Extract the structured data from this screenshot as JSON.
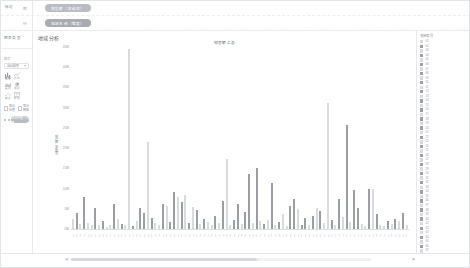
{
  "shelf": {
    "corner_label": "标记",
    "rows": [
      {
        "axis_label": "列  ",
        "pill": "销售额（求和项）"
      },
      {
        "axis_label": "行  ",
        "pill": "地域名称（维度）"
      }
    ]
  },
  "sidebar": {
    "title": "图表类型",
    "style_label": "样式",
    "select_value": "自动配色",
    "mark_icons": [
      {
        "name": "bar-icon",
        "cap": "柱形"
      },
      {
        "name": "line-icon",
        "cap": "折线"
      },
      {
        "name": "area-icon",
        "cap": "面积"
      },
      {
        "name": "pie-icon",
        "cap": "饼图"
      },
      {
        "name": "scatter-icon",
        "cap": "散点"
      },
      {
        "name": "table-icon",
        "cap": "表格"
      }
    ],
    "checkboxes": [
      {
        "label": "显示标签"
      },
      {
        "label": "显示网格"
      }
    ],
    "apply_button": "应用到整个视图"
  },
  "canvas": {
    "header": "地域分析",
    "legend_title": "地域编号"
  },
  "chart_data": {
    "type": "bar",
    "title": "销售额汇总",
    "xlabel": "",
    "ylabel": "销售额（求和项）",
    "ylim": [
      0,
      45000000
    ],
    "grid": false,
    "legend_position": "right",
    "ytick_labels": [
      "45M",
      "40M",
      "35M",
      "30M",
      "25M",
      "20M",
      "15M",
      "10M",
      "5M",
      "0M"
    ],
    "ytick_values": [
      45000000,
      40000000,
      35000000,
      30000000,
      25000000,
      20000000,
      15000000,
      10000000,
      5000000,
      0
    ],
    "colors": {
      "light": "#d8dadd",
      "dark": "#9b9ea2"
    },
    "categories": [
      "01",
      "02",
      "03",
      "04",
      "05",
      "06",
      "07",
      "08",
      "09",
      "10",
      "11",
      "12",
      "13",
      "14",
      "15",
      "16",
      "17",
      "18",
      "19",
      "20",
      "21",
      "22",
      "23",
      "24",
      "25",
      "26",
      "27",
      "28",
      "29",
      "30",
      "31",
      "32",
      "33",
      "34",
      "35",
      "36",
      "37",
      "38",
      "39",
      "40",
      "41",
      "42",
      "43",
      "44",
      "45",
      "46",
      "47",
      "48",
      "49",
      "50",
      "51",
      "52",
      "53",
      "54",
      "55",
      "56",
      "57",
      "58",
      "59",
      "60",
      "61",
      "62",
      "63",
      "64",
      "65",
      "66",
      "67",
      "68",
      "69",
      "70",
      "71",
      "72",
      "73",
      "74",
      "75",
      "76",
      "77",
      "78",
      "79",
      "80",
      "81",
      "82",
      "83",
      "84",
      "85",
      "86",
      "87",
      "88",
      "89",
      "90"
    ],
    "values": [
      2600000,
      3900000,
      1200000,
      7800000,
      1400000,
      900000,
      5200000,
      1100000,
      2100000,
      600000,
      900000,
      6300000,
      2400000,
      1300000,
      1000000,
      44500000,
      700000,
      2000000,
      5100000,
      3900000,
      21500000,
      2800000,
      1500000,
      1100000,
      6200000,
      5600000,
      1700000,
      9100000,
      7900000,
      6800000,
      8500000,
      1400000,
      5400000,
      4800000,
      1200000,
      2600000,
      1800000,
      900000,
      3100000,
      1600000,
      6900000,
      17200000,
      900000,
      2300000,
      6100000,
      1200000,
      4200000,
      13600000,
      1500000,
      15200000,
      1900000,
      1300000,
      2200000,
      11300000,
      1000000,
      1700000,
      3600000,
      800000,
      5800000,
      7300000,
      4900000,
      1100000,
      2700000,
      900000,
      3300000,
      5200000,
      4400000,
      1500000,
      31200000,
      2200000,
      1000000,
      7400000,
      2900000,
      25800000,
      1800000,
      9700000,
      5300000,
      1200000,
      700000,
      9900000,
      9800000,
      3600000,
      1000000,
      800000,
      2000000,
      1300000,
      2600000,
      1900000,
      4000000,
      1100000
    ],
    "series_shade": [
      0,
      1,
      0,
      1,
      0,
      0,
      1,
      0,
      1,
      0,
      0,
      1,
      0,
      1,
      0,
      0,
      1,
      0,
      1,
      1,
      0,
      1,
      0,
      0,
      1,
      0,
      1,
      1,
      0,
      1,
      0,
      1,
      0,
      1,
      0,
      1,
      0,
      0,
      1,
      0,
      1,
      0,
      0,
      1,
      1,
      0,
      1,
      1,
      0,
      1,
      0,
      1,
      0,
      1,
      0,
      1,
      0,
      0,
      1,
      1,
      0,
      1,
      1,
      0,
      1,
      0,
      1,
      0,
      0,
      1,
      0,
      1,
      0,
      1,
      0,
      1,
      1,
      0,
      0,
      1,
      0,
      1,
      0,
      0,
      1,
      0,
      1,
      0,
      1,
      0
    ]
  },
  "legend_items": [
    {
      "label": "01"
    },
    {
      "label": "02"
    },
    {
      "label": "03"
    },
    {
      "label": "04"
    },
    {
      "label": "05"
    },
    {
      "label": "06"
    },
    {
      "label": "07"
    },
    {
      "label": "08"
    },
    {
      "label": "09"
    },
    {
      "label": "10"
    },
    {
      "label": "11"
    },
    {
      "label": "12"
    },
    {
      "label": "13"
    },
    {
      "label": "14"
    },
    {
      "label": "15"
    },
    {
      "label": "16"
    },
    {
      "label": "17"
    },
    {
      "label": "18"
    },
    {
      "label": "19"
    },
    {
      "label": "20"
    },
    {
      "label": "21"
    },
    {
      "label": "22"
    },
    {
      "label": "23"
    },
    {
      "label": "24"
    },
    {
      "label": "25"
    },
    {
      "label": "26"
    },
    {
      "label": "27"
    },
    {
      "label": "28"
    },
    {
      "label": "29"
    },
    {
      "label": "30"
    },
    {
      "label": "31"
    },
    {
      "label": "32"
    },
    {
      "label": "33"
    },
    {
      "label": "34"
    },
    {
      "label": "35"
    },
    {
      "label": "36"
    },
    {
      "label": "37"
    },
    {
      "label": "38"
    },
    {
      "label": "39"
    },
    {
      "label": "40"
    },
    {
      "label": "41"
    },
    {
      "label": "42"
    },
    {
      "label": "43"
    },
    {
      "label": "44"
    },
    {
      "label": "45"
    },
    {
      "label": "46"
    },
    {
      "label": "47"
    }
  ],
  "statusbar": {
    "scroll_left": "◀",
    "scroll_right": "▶",
    "scroll_thumb_pct": 62
  }
}
